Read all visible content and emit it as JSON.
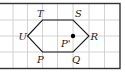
{
  "figure": {
    "type": "hexagon-on-grid",
    "grid": {
      "vertical_lines_x": [
        13,
        27.5,
        42.5,
        57.5,
        73,
        89,
        104.5
      ],
      "horizontal_lines_y": [
        20,
        36,
        52
      ],
      "border": {
        "left": -1,
        "top": 3.5,
        "right": 120,
        "bottom": 68.5
      },
      "line_color": "#c8c8c8",
      "border_color": "#333333"
    },
    "hexagon": {
      "vertices": [
        {
          "name": "U",
          "x": 27.5,
          "y": 36
        },
        {
          "name": "T",
          "x": 42.5,
          "y": 20
        },
        {
          "name": "S",
          "x": 73,
          "y": 20
        },
        {
          "name": "R",
          "x": 89,
          "y": 36
        },
        {
          "name": "Q",
          "x": 73,
          "y": 52
        },
        {
          "name": "P",
          "x": 42.5,
          "y": 52
        }
      ]
    },
    "labels": {
      "T": "T",
      "S": "S",
      "U": "U",
      "R": "R",
      "P": "P",
      "Q": "Q",
      "P_prime": "P'"
    },
    "point": {
      "name": "P'",
      "x": 73,
      "y": 36,
      "color": "#000000"
    }
  }
}
